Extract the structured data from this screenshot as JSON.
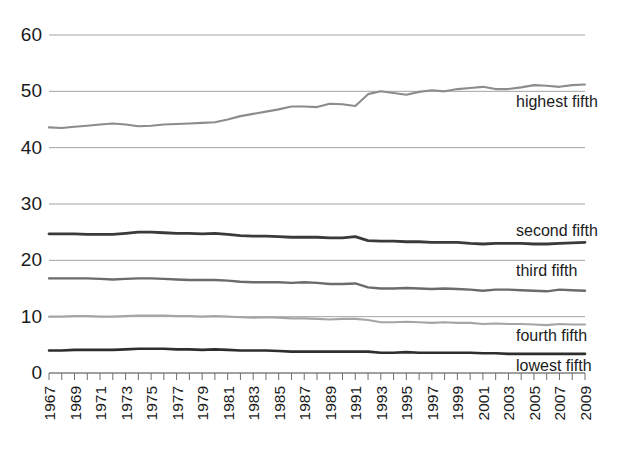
{
  "chart_data": {
    "type": "line",
    "title": "",
    "subtitle": "",
    "xlabel": "",
    "ylabel": "",
    "ylim": [
      0,
      60
    ],
    "xlim": [
      1967,
      2009
    ],
    "grid": true,
    "legend_position": "right-inline",
    "y_ticks": [
      0,
      10,
      20,
      30,
      40,
      50,
      60
    ],
    "y_tick_labels": [
      "0",
      "10",
      "20",
      "30",
      "40",
      "50",
      "60"
    ],
    "x_ticks": [
      1967,
      1969,
      1971,
      1973,
      1975,
      1977,
      1979,
      1981,
      1983,
      1985,
      1987,
      1989,
      1991,
      1993,
      1995,
      1997,
      1999,
      2001,
      2003,
      2005,
      2007,
      2009
    ],
    "x_tick_labels": [
      "1967",
      "1969",
      "1971",
      "1973",
      "1975",
      "1977",
      "1979",
      "1981",
      "1983",
      "1985",
      "1987",
      "1989",
      "1991",
      "1993",
      "1995",
      "1997",
      "1999",
      "2001",
      "2003",
      "2005",
      "2007",
      "2009"
    ],
    "x": [
      1967,
      1968,
      1969,
      1970,
      1971,
      1972,
      1973,
      1974,
      1975,
      1976,
      1977,
      1978,
      1979,
      1980,
      1981,
      1982,
      1983,
      1984,
      1985,
      1986,
      1987,
      1988,
      1989,
      1990,
      1991,
      1992,
      1993,
      1994,
      1995,
      1996,
      1997,
      1998,
      1999,
      2000,
      2001,
      2002,
      2003,
      2004,
      2005,
      2006,
      2007,
      2008,
      2009
    ],
    "series": [
      {
        "name": "highest fifth",
        "label": "highest fifth",
        "color": "#8c8c8c",
        "width": 2.1,
        "values": [
          43.6,
          43.5,
          43.7,
          43.9,
          44.1,
          44.3,
          44.1,
          43.8,
          43.9,
          44.1,
          44.2,
          44.3,
          44.4,
          44.5,
          45.0,
          45.6,
          46.0,
          46.4,
          46.8,
          47.3,
          47.3,
          47.2,
          47.8,
          47.7,
          47.4,
          49.5,
          50.0,
          49.7,
          49.4,
          49.9,
          50.2,
          50.0,
          50.4,
          50.6,
          50.8,
          50.4,
          50.4,
          50.7,
          51.1,
          51.0,
          50.8,
          51.1,
          51.2
        ]
      },
      {
        "name": "second fifth",
        "label": "second fifth",
        "color": "#3a3a3a",
        "width": 2.8,
        "values": [
          24.7,
          24.7,
          24.7,
          24.6,
          24.6,
          24.6,
          24.8,
          25.0,
          25.0,
          24.9,
          24.8,
          24.8,
          24.7,
          24.8,
          24.6,
          24.4,
          24.3,
          24.3,
          24.2,
          24.1,
          24.1,
          24.1,
          24.0,
          24.0,
          24.2,
          23.5,
          23.4,
          23.4,
          23.3,
          23.3,
          23.2,
          23.2,
          23.2,
          23.0,
          22.9,
          23.0,
          23.0,
          23.0,
          22.9,
          22.9,
          23.0,
          23.1,
          23.2
        ]
      },
      {
        "name": "third fifth",
        "label": "third fifth",
        "color": "#6b6b6b",
        "width": 2.4,
        "values": [
          16.8,
          16.8,
          16.8,
          16.8,
          16.7,
          16.6,
          16.7,
          16.8,
          16.8,
          16.7,
          16.6,
          16.5,
          16.5,
          16.5,
          16.4,
          16.2,
          16.1,
          16.1,
          16.1,
          16.0,
          16.1,
          16.0,
          15.8,
          15.8,
          15.9,
          15.2,
          15.0,
          15.0,
          15.1,
          15.0,
          14.9,
          15.0,
          14.9,
          14.8,
          14.6,
          14.8,
          14.8,
          14.7,
          14.6,
          14.5,
          14.8,
          14.7,
          14.6
        ]
      },
      {
        "name": "fourth fifth",
        "label": "fourth fifth",
        "color": "#a5a5a5",
        "width": 2.1,
        "values": [
          10.0,
          10.0,
          10.1,
          10.1,
          10.0,
          10.0,
          10.1,
          10.2,
          10.2,
          10.2,
          10.1,
          10.1,
          10.0,
          10.1,
          10.0,
          9.9,
          9.8,
          9.9,
          9.8,
          9.7,
          9.7,
          9.6,
          9.5,
          9.6,
          9.6,
          9.4,
          9.0,
          9.0,
          9.1,
          9.0,
          8.9,
          9.0,
          8.9,
          8.9,
          8.7,
          8.8,
          8.7,
          8.7,
          8.6,
          8.5,
          8.7,
          8.6,
          8.6
        ]
      },
      {
        "name": "lowest fifth",
        "label": "lowest fifth",
        "color": "#2e2e2e",
        "width": 2.6,
        "values": [
          4.0,
          4.0,
          4.1,
          4.1,
          4.1,
          4.1,
          4.2,
          4.3,
          4.3,
          4.3,
          4.2,
          4.2,
          4.1,
          4.2,
          4.1,
          4.0,
          4.0,
          4.0,
          3.9,
          3.8,
          3.8,
          3.8,
          3.8,
          3.8,
          3.8,
          3.8,
          3.6,
          3.6,
          3.7,
          3.6,
          3.6,
          3.6,
          3.6,
          3.6,
          3.5,
          3.5,
          3.4,
          3.4,
          3.4,
          3.4,
          3.4,
          3.4,
          3.4
        ]
      }
    ]
  },
  "axes": {
    "y_axis_name": "y-axis",
    "x_axis_name": "x-axis"
  }
}
